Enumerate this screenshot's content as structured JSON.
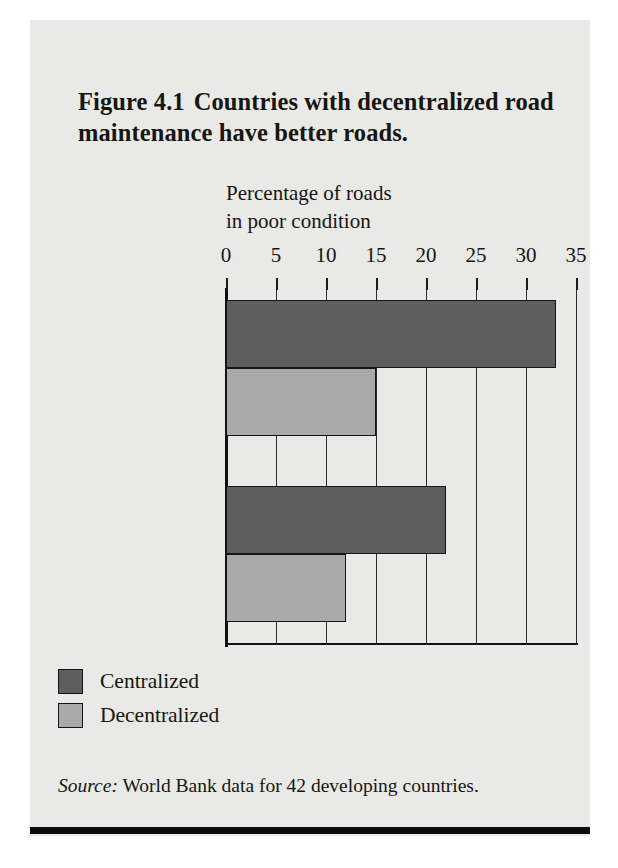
{
  "figure": {
    "number": "Figure 4.1",
    "title": "Countries with decentralized road maintenance have better roads.",
    "source_prefix": "Source:",
    "source_text": "World Bank data for 42 developing countries."
  },
  "legend": {
    "items": [
      {
        "label": "Centralized",
        "color": "#5e5e5e"
      },
      {
        "label": "Decentralized",
        "color": "#a9a9a9"
      }
    ]
  },
  "chart_data": {
    "type": "bar",
    "orientation": "horizontal",
    "title": "Countries with decentralized road maintenance have better roads.",
    "xlabel_line1": "Percentage of roads",
    "xlabel_line2": "in poor condition",
    "ylabel": "",
    "categories": [
      "Unpaved roads",
      "Paved roads"
    ],
    "xticks": [
      0,
      5,
      10,
      15,
      20,
      25,
      30,
      35
    ],
    "xlim": [
      0,
      35
    ],
    "grid": true,
    "legend_position": "below-left",
    "series": [
      {
        "name": "Centralized",
        "color": "#5e5e5e",
        "values": [
          33,
          22
        ]
      },
      {
        "name": "Decentralized",
        "color": "#a9a9a9",
        "values": [
          15,
          12
        ]
      }
    ]
  }
}
